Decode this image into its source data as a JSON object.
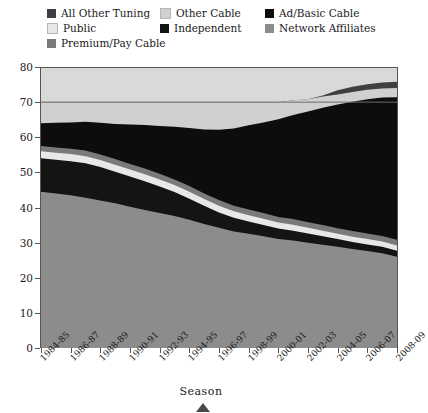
{
  "legend": {
    "rows": [
      [
        {
          "label": "All Other Tuning",
          "color": "#3f3f3f"
        },
        {
          "label": "Other Cable",
          "color": "#d0d0d0"
        },
        {
          "label": "Ad/Basic Cable",
          "color": "#0d0d0d"
        }
      ],
      [
        {
          "label": "Public",
          "color": "#e8e8e8"
        },
        {
          "label": "Independent",
          "color": "#141414"
        },
        {
          "label": "Network Affiliates",
          "color": "#8c8c8c"
        }
      ],
      [
        {
          "label": "Premium/Pay Cable",
          "color": "#7a7a7a"
        }
      ]
    ]
  },
  "chart_data": {
    "type": "area",
    "stacked": true,
    "title": "",
    "xlabel": "Season",
    "ylabel": "",
    "ylim": [
      0,
      80
    ],
    "yticks": [
      0,
      10,
      20,
      30,
      40,
      50,
      60,
      70,
      80
    ],
    "grid": true,
    "gridlines_at": [
      70
    ],
    "legend_position": "top",
    "categories": [
      "1984-85",
      "1985-86",
      "1986-87",
      "1987-88",
      "1988-89",
      "1989-90",
      "1990-91",
      "1991-92",
      "1992-93",
      "1993-94",
      "1994-95",
      "1995-96",
      "1996-97",
      "1997-98",
      "1998-99",
      "1999-00",
      "2000-01",
      "2001-02",
      "2002-03",
      "2003-04",
      "2004-05",
      "2005-06",
      "2006-07",
      "2007-08",
      "2008-09"
    ],
    "x_tick_labels": [
      "1984-85",
      "1986-87",
      "1988-89",
      "1990-91",
      "1992-93",
      "1994-95",
      "1996-97",
      "1998-99",
      "2000-01",
      "2002-03",
      "2004-05",
      "2006-07",
      "2008-09"
    ],
    "series": [
      {
        "name": "Network Affiliates",
        "color": "#8c8c8c",
        "values": [
          44.5,
          44.0,
          43.5,
          42.8,
          42.0,
          41.2,
          40.2,
          39.3,
          38.4,
          37.6,
          36.5,
          35.3,
          34.2,
          33.2,
          32.5,
          31.8,
          31.0,
          30.6,
          30.0,
          29.4,
          28.8,
          28.2,
          27.6,
          27.0,
          26.0
        ]
      },
      {
        "name": "Independent",
        "color": "#141414",
        "values": [
          9.5,
          9.6,
          9.7,
          9.8,
          9.5,
          9.0,
          8.6,
          8.2,
          7.6,
          6.8,
          6.0,
          5.2,
          4.4,
          3.9,
          3.5,
          3.2,
          3.0,
          2.8,
          2.6,
          2.4,
          2.2,
          2.0,
          1.9,
          1.8,
          1.7
        ]
      },
      {
        "name": "Public",
        "color": "#e8e8e8",
        "values": [
          2.0,
          2.0,
          2.0,
          2.0,
          2.0,
          2.0,
          2.0,
          2.0,
          2.0,
          2.0,
          2.0,
          1.9,
          1.9,
          1.8,
          1.8,
          1.8,
          1.7,
          1.7,
          1.6,
          1.6,
          1.5,
          1.5,
          1.5,
          1.5,
          1.5
        ]
      },
      {
        "name": "Premium/Pay Cable",
        "color": "#7a7a7a",
        "values": [
          1.5,
          1.5,
          1.5,
          1.6,
          1.6,
          1.6,
          1.6,
          1.6,
          1.6,
          1.6,
          1.6,
          1.6,
          1.6,
          1.6,
          1.6,
          1.6,
          1.6,
          1.6,
          1.6,
          1.6,
          1.6,
          1.6,
          1.6,
          1.6,
          1.6
        ]
      },
      {
        "name": "Ad/Basic Cable",
        "color": "#0d0d0d",
        "values": [
          6.5,
          7.0,
          7.5,
          8.2,
          9.0,
          10.0,
          11.2,
          12.4,
          13.6,
          15.0,
          16.5,
          18.2,
          20.0,
          22.0,
          24.0,
          25.8,
          27.8,
          29.6,
          31.5,
          33.4,
          35.2,
          36.8,
          38.2,
          39.4,
          40.6
        ]
      },
      {
        "name": "Other Cable",
        "color": "#d0d0d0",
        "values": [
          6.0,
          5.9,
          5.8,
          5.6,
          5.9,
          6.2,
          6.4,
          6.5,
          6.8,
          7.0,
          7.4,
          7.8,
          7.9,
          7.5,
          6.6,
          5.8,
          4.9,
          4.2,
          3.5,
          3.2,
          2.9,
          2.8,
          2.7,
          2.6,
          2.6
        ]
      },
      {
        "name": "All Other Tuning",
        "color": "#3f3f3f",
        "values": [
          0,
          0,
          0,
          0,
          0,
          0,
          0,
          0,
          0,
          0,
          0,
          0,
          0,
          0,
          0,
          0,
          0,
          0,
          0,
          0.3,
          1.2,
          1.5,
          1.6,
          1.7,
          1.8
        ]
      }
    ],
    "totals": [
      70.0,
      70.0,
      70.0,
      70.0,
      70.0,
      70.0,
      70.0,
      70.0,
      70.0,
      70.0,
      70.0,
      70.0,
      70.0,
      70.0,
      70.0,
      70.0,
      70.0,
      70.5,
      70.8,
      71.9,
      73.4,
      73.4,
      73.1,
      73.6,
      74.8
    ]
  },
  "marker": {
    "shape": "triangle-up"
  }
}
